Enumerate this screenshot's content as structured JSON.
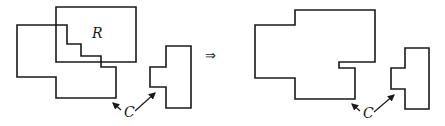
{
  "diagram": {
    "labels": {
      "region": "R",
      "component_left": "C",
      "component_right": "C",
      "implies": "⇒"
    },
    "colors": {
      "stroke": "#1a1a1a",
      "background": "#ffffff"
    },
    "before": {
      "region_R": [
        [
          56,
          7
        ],
        [
          136,
          7
        ],
        [
          136,
          62
        ],
        [
          56,
          62
        ]
      ],
      "component_stair": [
        [
          17,
          25
        ],
        [
          67,
          25
        ],
        [
          67,
          44
        ],
        [
          81,
          44
        ],
        [
          81,
          56
        ],
        [
          101,
          56
        ],
        [
          101,
          67
        ],
        [
          116,
          67
        ],
        [
          116,
          98
        ],
        [
          56,
          98
        ],
        [
          56,
          77
        ],
        [
          17,
          77
        ]
      ],
      "component_T": [
        [
          166,
          46
        ],
        [
          191,
          46
        ],
        [
          191,
          108
        ],
        [
          166,
          108
        ],
        [
          166,
          87
        ],
        [
          150,
          87
        ],
        [
          150,
          67
        ],
        [
          166,
          67
        ]
      ]
    },
    "after": {
      "merged": [
        [
          255,
          25
        ],
        [
          295,
          25
        ],
        [
          295,
          10
        ],
        [
          375,
          10
        ],
        [
          375,
          62
        ],
        [
          339,
          62
        ],
        [
          339,
          68
        ],
        [
          355,
          68
        ],
        [
          355,
          99
        ],
        [
          295,
          99
        ],
        [
          295,
          78
        ],
        [
          255,
          78
        ]
      ],
      "component_T": [
        [
          405,
          48
        ],
        [
          429,
          48
        ],
        [
          429,
          109
        ],
        [
          405,
          109
        ],
        [
          405,
          89
        ],
        [
          391,
          89
        ],
        [
          391,
          68
        ],
        [
          405,
          68
        ]
      ]
    }
  }
}
